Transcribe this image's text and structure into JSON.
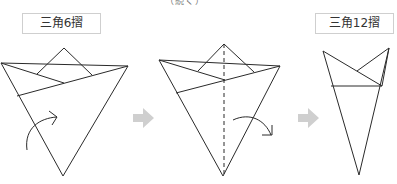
{
  "caption_top": "（続く）",
  "labels": {
    "step1": "三角6摺",
    "step2": "三角12摺"
  },
  "colors": {
    "line": "#2a2a2a",
    "step_arrow": "#cfcfcf",
    "border": "#cfcfcf"
  },
  "figures": [
    {
      "name": "triangle-6-fold",
      "description": "inverted triangle with top flaps, curved arrow indicating fold"
    },
    {
      "name": "triangle-fold-in-half",
      "description": "inverted triangle with dashed center fold line and curved arrow"
    },
    {
      "name": "triangle-12-fold",
      "description": "narrow folded cone shape result"
    }
  ]
}
